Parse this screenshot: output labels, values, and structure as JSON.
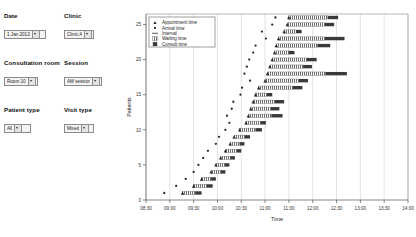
{
  "controls": {
    "date": {
      "label": "Date",
      "value": "1 Jan 2013",
      "icon": "dropdown-arrow-icon"
    },
    "clinic": {
      "label": "Clinic",
      "value": "Clinic A",
      "icon": "dropdown-arrow-icon"
    },
    "consultation_room": {
      "label": "Consultation room",
      "value": "Room 10",
      "icon": "dropdown-arrow-icon"
    },
    "session": {
      "label": "Session",
      "value": "AM session",
      "icon": "dropdown-arrow-icon"
    },
    "patient_type": {
      "label": "Patient type",
      "value": "All",
      "icon": "dropdown-arrow-icon"
    },
    "visit_type": {
      "label": "Visit type",
      "value": "Mixed",
      "icon": "dropdown-arrow-icon"
    }
  },
  "chart_data": {
    "type": "bar",
    "title": "",
    "xlabel": "Time",
    "ylabel": "Patients",
    "xticklabels": [
      "08:30",
      "09:00",
      "09:30",
      "10:00",
      "10:30",
      "11:00",
      "11:30",
      "12:00",
      "12:30",
      "13:00",
      "13:30",
      "14:00"
    ],
    "xlim_minutes": [
      510,
      840
    ],
    "ylim": [
      0,
      26.5
    ],
    "yticks": [
      0,
      5,
      10,
      15,
      20,
      25
    ],
    "grid": true,
    "legend_position": "upper-left",
    "legend": [
      {
        "label": "Appointment time",
        "marker": "triangle",
        "color": "#2b2b2b"
      },
      {
        "label": "Arrival time",
        "marker": "dot",
        "color": "#2b2b2b"
      },
      {
        "label": "Interval",
        "marker": "line",
        "color": "#444444"
      },
      {
        "label": "Waiting time",
        "marker": "hatched-box",
        "color": "#8c8c8c"
      },
      {
        "label": "Consult time",
        "marker": "solid-box",
        "color": "#3a3a3a"
      }
    ],
    "series_names": [
      "appointment",
      "arrival",
      "waiting",
      "consult"
    ],
    "patients": [
      {
        "y": 26,
        "appointment": 690,
        "arrival": 673,
        "wait_start": 690,
        "wait_end": 739,
        "consult_start": 739,
        "consult_end": 752
      },
      {
        "y": 25,
        "appointment": 688,
        "arrival": 669,
        "wait_start": 688,
        "wait_end": 735,
        "consult_start": 735,
        "consult_end": 747
      },
      {
        "y": 24,
        "appointment": 684,
        "arrival": 656,
        "wait_start": 684,
        "wait_end": 699,
        "consult_start": 699,
        "consult_end": 706
      },
      {
        "y": 23,
        "appointment": 677,
        "arrival": 661,
        "wait_start": 677,
        "wait_end": 735,
        "consult_start": 735,
        "consult_end": 760
      },
      {
        "y": 22,
        "appointment": 674,
        "arrival": 648,
        "wait_start": 674,
        "wait_end": 726,
        "consult_start": 726,
        "consult_end": 742
      },
      {
        "y": 21,
        "appointment": 672,
        "arrival": 645,
        "wait_start": 672,
        "wait_end": 690,
        "consult_start": 690,
        "consult_end": 697
      },
      {
        "y": 20,
        "appointment": 669,
        "arrival": 640,
        "wait_start": 669,
        "wait_end": 712,
        "consult_start": 712,
        "consult_end": 725
      },
      {
        "y": 19,
        "appointment": 666,
        "arrival": 637,
        "wait_start": 666,
        "wait_end": 708,
        "consult_start": 708,
        "consult_end": 719
      },
      {
        "y": 18,
        "appointment": 663,
        "arrival": 634,
        "wait_start": 663,
        "wait_end": 736,
        "consult_start": 736,
        "consult_end": 763
      },
      {
        "y": 17,
        "appointment": 660,
        "arrival": 641,
        "wait_start": 660,
        "wait_end": 702,
        "consult_start": 702,
        "consult_end": 714
      },
      {
        "y": 16,
        "appointment": 652,
        "arrival": 631,
        "wait_start": 652,
        "wait_end": 695,
        "consult_start": 695,
        "consult_end": 707
      },
      {
        "y": 15,
        "appointment": 648,
        "arrival": 629,
        "wait_start": 648,
        "wait_end": 662,
        "consult_start": 662,
        "consult_end": 669
      },
      {
        "y": 14,
        "appointment": 645,
        "arrival": 620,
        "wait_start": 645,
        "wait_end": 672,
        "consult_start": 672,
        "consult_end": 684
      },
      {
        "y": 13,
        "appointment": 642,
        "arrival": 618,
        "wait_start": 642,
        "wait_end": 667,
        "consult_start": 667,
        "consult_end": 678
      },
      {
        "y": 12,
        "appointment": 639,
        "arrival": 612,
        "wait_start": 639,
        "wait_end": 668,
        "consult_start": 668,
        "consult_end": 682
      },
      {
        "y": 11,
        "appointment": 636,
        "arrival": 615,
        "wait_start": 636,
        "wait_end": 654,
        "consult_start": 654,
        "consult_end": 661
      },
      {
        "y": 10,
        "appointment": 628,
        "arrival": 610,
        "wait_start": 628,
        "wait_end": 648,
        "consult_start": 648,
        "consult_end": 656
      },
      {
        "y": 9,
        "appointment": 621,
        "arrival": 602,
        "wait_start": 621,
        "wait_end": 634,
        "consult_start": 634,
        "consult_end": 641
      },
      {
        "y": 8,
        "appointment": 616,
        "arrival": 598,
        "wait_start": 616,
        "wait_end": 628,
        "consult_start": 628,
        "consult_end": 634
      },
      {
        "y": 7,
        "appointment": 610,
        "arrival": 588,
        "wait_start": 610,
        "wait_end": 624,
        "consult_start": 624,
        "consult_end": 630
      },
      {
        "y": 6,
        "appointment": 604,
        "arrival": 582,
        "wait_start": 604,
        "wait_end": 616,
        "consult_start": 616,
        "consult_end": 622
      },
      {
        "y": 5,
        "appointment": 598,
        "arrival": 576,
        "wait_start": 598,
        "wait_end": 609,
        "consult_start": 609,
        "consult_end": 615
      },
      {
        "y": 4,
        "appointment": 592,
        "arrival": 570,
        "wait_start": 592,
        "wait_end": 604,
        "consult_start": 604,
        "consult_end": 610
      },
      {
        "y": 3,
        "appointment": 580,
        "arrival": 560,
        "wait_start": 580,
        "wait_end": 592,
        "consult_start": 592,
        "consult_end": 598
      },
      {
        "y": 2,
        "appointment": 570,
        "arrival": 548,
        "wait_start": 570,
        "wait_end": 586,
        "consult_start": 586,
        "consult_end": 594
      },
      {
        "y": 1,
        "appointment": 556,
        "arrival": 533,
        "wait_start": 556,
        "wait_end": 572,
        "consult_start": 572,
        "consult_end": 580
      }
    ]
  }
}
